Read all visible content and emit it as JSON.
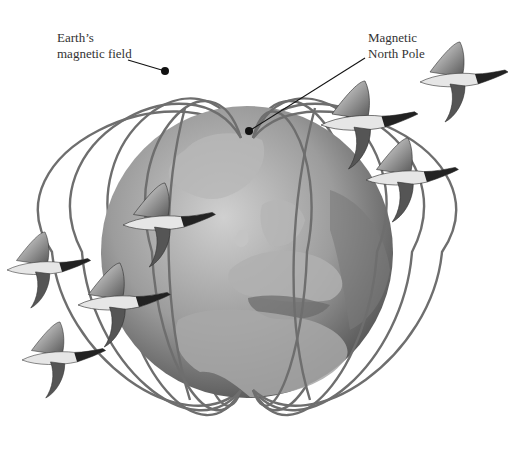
{
  "figure": {
    "labels": {
      "magnetic_field": {
        "line1": "Earth’s",
        "line2": "magnetic field"
      },
      "north_pole": {
        "line1": "Magnetic",
        "line2": "North Pole"
      }
    },
    "geese_count": 8,
    "colors": {
      "background": "#ffffff",
      "field_lines": "#6e6e6e",
      "globe_light": "#bdbdbd",
      "globe_dark": "#4a4a4a",
      "land": "#9a9a9a",
      "leader": "#111111",
      "label_text": "#333333"
    }
  }
}
